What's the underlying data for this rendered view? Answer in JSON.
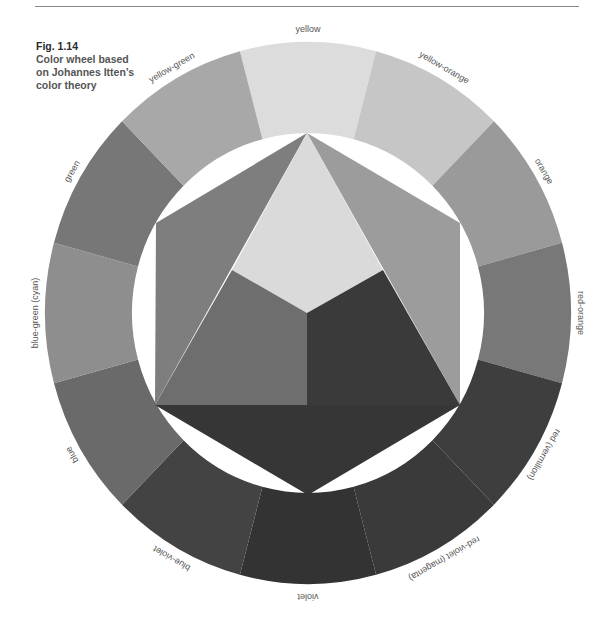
{
  "figure": {
    "number": "Fig. 1.14",
    "caption_lines": [
      "Color wheel based",
      "on Johannes Itten’s",
      "color theory"
    ]
  },
  "wheel": {
    "center": [
      308,
      313
    ],
    "outer_radius_x": 263,
    "outer_radius_y": 271,
    "inner_radius_x": 176,
    "inner_radius_y": 180,
    "label_radius_x": 272,
    "label_radius_y": 283,
    "segments": [
      {
        "label": "yellow",
        "angle": -90,
        "color": "#dcdcdc"
      },
      {
        "label": "yellow-orange",
        "angle": -60,
        "color": "#c6c6c6"
      },
      {
        "label": "orange",
        "angle": -30,
        "color": "#9a9a9a"
      },
      {
        "label": "red-orange",
        "angle": 0,
        "color": "#787878"
      },
      {
        "label": "red (vermilion)",
        "angle": 30,
        "color": "#3e3e3e"
      },
      {
        "label": "red-violet (magenta)",
        "angle": 60,
        "color": "#3a3a3a"
      },
      {
        "label": "violet",
        "angle": 90,
        "color": "#333333"
      },
      {
        "label": "blue-violet",
        "angle": 120,
        "color": "#434343"
      },
      {
        "label": "blue",
        "angle": 150,
        "color": "#6a6a6a"
      },
      {
        "label": "blue-green (cyan)",
        "angle": 180,
        "color": "#8e8e8e"
      },
      {
        "label": "green",
        "angle": 210,
        "color": "#777777"
      },
      {
        "label": "yellow-green",
        "angle": 240,
        "color": "#a8a8a8"
      }
    ]
  },
  "center_shapes": {
    "hexagon_vertices": {
      "top": [
        307,
        133
      ],
      "upper_right": [
        460,
        223
      ],
      "lower_right": [
        460,
        405
      ],
      "bottom": [
        308,
        495
      ],
      "lower_left": [
        155,
        405
      ],
      "upper_left": [
        156,
        223
      ]
    },
    "inner_center": [
      307,
      313
    ],
    "inner_left": [
      232,
      270
    ],
    "inner_right": [
      383,
      270
    ],
    "regions": [
      {
        "name": "green-hex-triangle",
        "color": "#7e7e7e"
      },
      {
        "name": "orange-hex-triangle",
        "color": "#9c9c9c"
      },
      {
        "name": "violet-hex-triangle",
        "color": "#363636"
      },
      {
        "name": "yellow-inner",
        "color": "#dadada"
      },
      {
        "name": "blue-inner",
        "color": "#6e6e6e"
      },
      {
        "name": "red-inner",
        "color": "#3a3a3a"
      }
    ]
  }
}
